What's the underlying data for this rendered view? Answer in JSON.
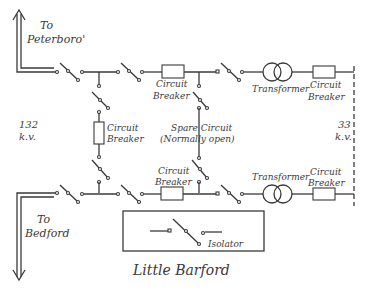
{
  "diagram": {
    "title": "Little Barford",
    "labels": {
      "to_peterboro": [
        "To",
        "Peterboro'"
      ],
      "to_bedford": [
        "To",
        "Bedford"
      ],
      "voltage_left": [
        "132",
        "k.v."
      ],
      "voltage_right": [
        "33",
        "k.v."
      ],
      "cb_top": [
        "Circuit",
        "Breaker"
      ],
      "cb_top_right": [
        "Circuit",
        "Breaker"
      ],
      "cb_left": [
        "Circuit",
        "Breaker"
      ],
      "spare": [
        "Spare Circuit",
        "(Normally open)"
      ],
      "cb_bottom": [
        "Circuit",
        "Breaker"
      ],
      "cb_bottom_right": [
        "Circuit",
        "Breaker"
      ],
      "transformer_top": "Transformer",
      "transformer_bottom": "Transformer",
      "legend_isolator": "Isolator"
    },
    "colors": {
      "ink": "#3a3a3a",
      "background": "#ffffff"
    }
  }
}
